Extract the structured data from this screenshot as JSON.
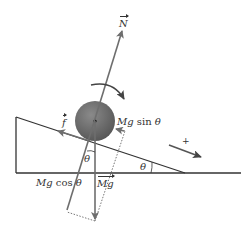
{
  "diagram": {
    "labels": {
      "normal_force": "N",
      "friction": "f",
      "gravity": "Mg",
      "gravity_parallel_M": "Mg",
      "gravity_parallel_sin": "sin",
      "gravity_parallel_theta": "θ",
      "gravity_perp_M": "Mg",
      "gravity_perp_cos": "cos",
      "gravity_perp_theta": "θ",
      "angle_at_ball": "θ",
      "incline_angle": "θ",
      "positive_direction": "+"
    },
    "colors": {
      "arrow": "#6e6e6e",
      "ramp": "#333333",
      "ball": "#6a6a6a",
      "dotted": "#555555"
    }
  }
}
